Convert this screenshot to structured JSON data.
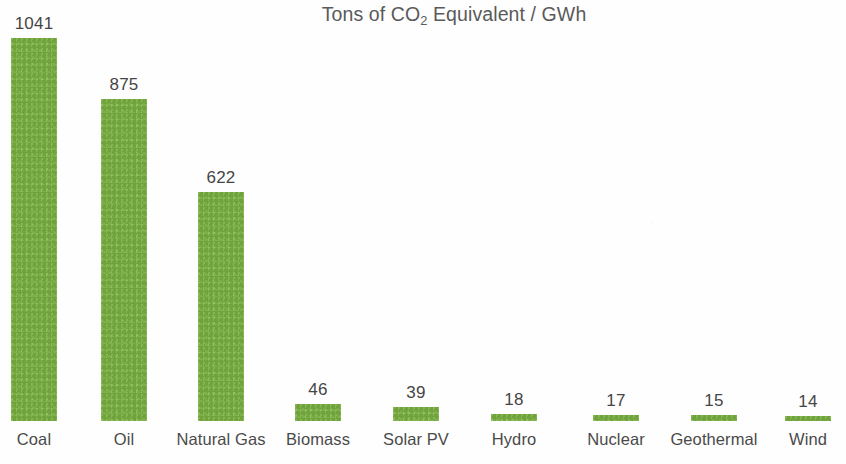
{
  "chart_data": {
    "type": "bar",
    "title": "Tons of CO2 Equivalent / GWh",
    "title_prefix": "Tons of CO",
    "title_subscript": "2",
    "title_suffix": " Equivalent / GWh",
    "xlabel": "",
    "ylabel": "",
    "ylim": [
      0,
      1041
    ],
    "grid": false,
    "legend": "none",
    "axis_visible": false,
    "data_labels": true,
    "bar_color": "#7cb342",
    "text_color": "#454545",
    "background_color": "#fefefe",
    "categories": [
      "Coal",
      "Oil",
      "Natural Gas",
      "Biomass",
      "Solar PV",
      "Hydro",
      "Nuclear",
      "Geothermal",
      "Wind"
    ],
    "values": [
      1041,
      875,
      622,
      46,
      39,
      18,
      17,
      15,
      14
    ],
    "value_labels": [
      "1041",
      "875",
      "622",
      "46",
      "39",
      "18",
      "17",
      "15",
      "14"
    ],
    "series": [
      {
        "name": "Tons of CO2 Equivalent / GWh",
        "values": [
          1041,
          875,
          622,
          46,
          39,
          18,
          17,
          15,
          14
        ]
      }
    ],
    "points": [
      {
        "category": "Coal",
        "value": 1041,
        "label": "1041"
      },
      {
        "category": "Oil",
        "value": 875,
        "label": "875"
      },
      {
        "category": "Natural Gas",
        "value": 622,
        "label": "622"
      },
      {
        "category": "Biomass",
        "value": 46,
        "label": "46"
      },
      {
        "category": "Solar PV",
        "value": 39,
        "label": "39"
      },
      {
        "category": "Hydro",
        "value": 18,
        "label": "18"
      },
      {
        "category": "Nuclear",
        "value": 17,
        "label": "17"
      },
      {
        "category": "Geothermal",
        "value": 15,
        "label": "15"
      },
      {
        "category": "Wind",
        "value": 14,
        "label": "14"
      }
    ]
  },
  "layout": {
    "plot_height_px": 421,
    "baseline_y_px": 421,
    "px_per_unit": 0.368,
    "bar_width_px": 46,
    "bar_centers_px": [
      34,
      124,
      221,
      318,
      416,
      514,
      616,
      714,
      808
    ]
  }
}
